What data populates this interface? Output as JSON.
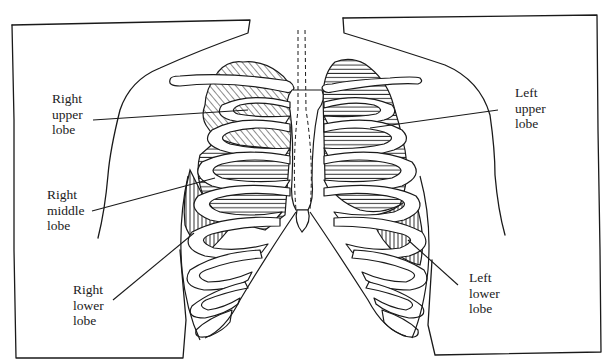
{
  "diagram": {
    "colors": {
      "ink": "#1a1a1a",
      "background": "#ffffff"
    },
    "hatching": {
      "right_upper_lobe": "diagonal",
      "right_middle_lobe": "horizontal",
      "right_lower_lobe": "vertical",
      "left_upper_lobe": "horizontal",
      "left_lower_lobe": "vertical"
    },
    "labels": [
      {
        "id": "right-upper-lobe",
        "text": "Right\nupper\nlobe",
        "x": 52,
        "y": 91
      },
      {
        "id": "right-middle-lobe",
        "text": "Right\nmiddle\nlobe",
        "x": 47,
        "y": 187
      },
      {
        "id": "right-lower-lobe",
        "text": "Right\nlower\nlobe",
        "x": 73,
        "y": 282
      },
      {
        "id": "left-upper-lobe",
        "text": "Left\nupper\nlobe",
        "x": 515,
        "y": 85
      },
      {
        "id": "left-lower-lobe",
        "text": "Left\nlower\nlobe",
        "x": 469,
        "y": 270
      }
    ]
  }
}
